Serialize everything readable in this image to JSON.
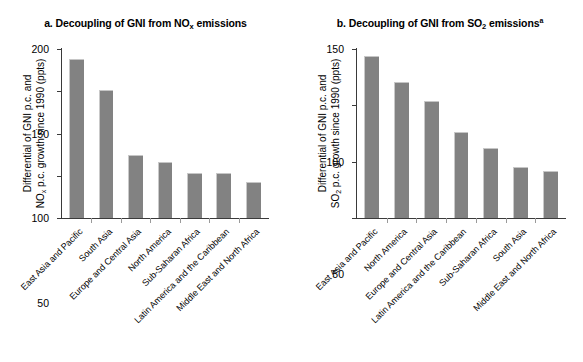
{
  "chart_data": [
    {
      "type": "bar",
      "panel_id": "a",
      "title_prefix": "a. Decoupling of GNI from NO",
      "title_sub": "x",
      "title_suffix": " emissions",
      "title_full": "a. Decoupling of GNI from NOx emissions",
      "ylabel_line1": "Differential of GNI p.c. and",
      "ylabel_line2_prefix": "NO",
      "ylabel_line2_sub": "x",
      "ylabel_line2_suffix": " p.c. growth since 1990 (ppts)",
      "ylabel": "Differential of GNI p.c. and NOx p.c. growth since 1990 (ppts)",
      "xlabel": "",
      "ylim": [
        0,
        200
      ],
      "yticks": [
        0,
        50,
        100,
        150,
        200
      ],
      "ytick_labels": [
        "0",
        "50",
        "100",
        "150",
        "200"
      ],
      "grid": false,
      "legend": "none",
      "bar_color": "#828282",
      "categories": [
        "East Asia and Pacific",
        "South Asia",
        "Europe and Central Asia",
        "North America",
        "Sub-Saharan Africa",
        "Latin America and the Caribbean",
        "Middle East and North Africa"
      ],
      "values": [
        188,
        152,
        75,
        66,
        53,
        53,
        43
      ]
    },
    {
      "type": "bar",
      "panel_id": "b",
      "title_prefix": "b. Decoupling of GNI from SO",
      "title_sub": "2",
      "title_suffix": " emissions",
      "title_note": "a",
      "title_full": "b. Decoupling of GNI from SO2 emissionsa",
      "ylabel_line1": "Differential of GNI p.c. and",
      "ylabel_line2_prefix": "SO",
      "ylabel_line2_sub": "2",
      "ylabel_line2_suffix": " p.c. growth since 1990 (ppts)",
      "ylabel": "Differential of GNI p.c. and SO2 p.c. growth since 1990 (ppts)",
      "xlabel": "",
      "ylim": [
        0,
        150
      ],
      "yticks": [
        0,
        50,
        100,
        150
      ],
      "ytick_labels": [
        "0",
        "50",
        "100",
        "150"
      ],
      "grid": false,
      "legend": "none",
      "bar_color": "#828282",
      "categories": [
        "East Asia and Pacific",
        "North America",
        "Europe and Central Asia",
        "Latin America and the Caribbean",
        "Sub-Saharan Africa",
        "South Asia",
        "Middle East and North Africa"
      ],
      "values": [
        144,
        121,
        104,
        76,
        62,
        45,
        42
      ]
    }
  ]
}
